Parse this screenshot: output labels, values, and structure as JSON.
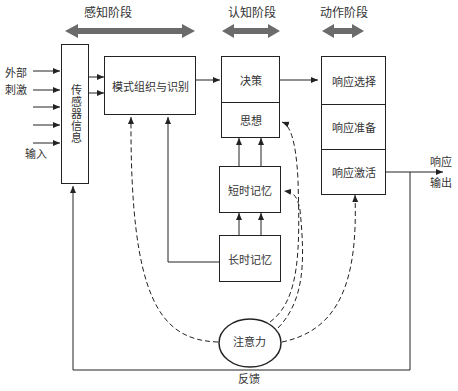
{
  "stages": {
    "perception": "感知阶段",
    "cognition": "认知阶段",
    "action": "动作阶段"
  },
  "inputs": {
    "external_stimuli_line1": "外部",
    "external_stimuli_line2": "刺激",
    "input": "输入"
  },
  "boxes": {
    "sensory_info": "传感器信息",
    "pattern_recognition": "模式组织与识别",
    "decision": "决策",
    "thinking": "思想",
    "short_term_memory": "短时记忆",
    "long_term_memory": "长时记忆",
    "response_selection": "响应选择",
    "response_preparation": "响应准备",
    "response_activation": "响应激活",
    "attention": "注意力"
  },
  "outputs": {
    "response_line1": "响应",
    "response_line2": "输出",
    "feedback": "反馈"
  },
  "colors": {
    "stage_arrow": "#6b6b6b",
    "line": "#222222"
  }
}
